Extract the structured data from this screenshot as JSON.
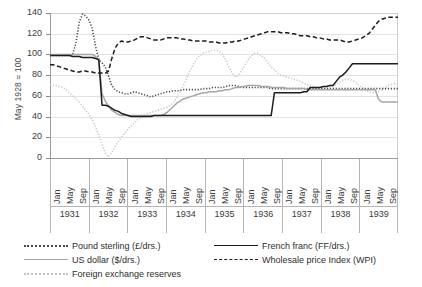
{
  "chart_data": {
    "type": "line",
    "title": "",
    "xlabel": "",
    "ylabel": "May 1928 = 100",
    "ylim": [
      0,
      140
    ],
    "ytick_labels": [
      "0",
      "20",
      "40",
      "60",
      "80",
      "100",
      "120",
      "140"
    ],
    "yticks": [
      0,
      20,
      40,
      60,
      80,
      100,
      120,
      140
    ],
    "grid": true,
    "legend_position": "bottom",
    "years": [
      "1931",
      "1932",
      "1933",
      "1934",
      "1935",
      "1936",
      "1937",
      "1938",
      "1939"
    ],
    "month_ticks": [
      "Jan",
      "May",
      "Sep"
    ],
    "x_start": "1931-01",
    "x_end": "1939-12",
    "series": [
      {
        "name": "Pound sterling (£/drs.)",
        "style": "dotted",
        "color": "#4a4a4a",
        "values": [
          99,
          99,
          99,
          99,
          99,
          99,
          99,
          100,
          112,
          131,
          139,
          137,
          133,
          125,
          108,
          95,
          92,
          88,
          79,
          70,
          66,
          64,
          63,
          62,
          62,
          63,
          64,
          63,
          62,
          61,
          60,
          59,
          60,
          61,
          62,
          63,
          64,
          64,
          65,
          65,
          65,
          66,
          66,
          66,
          66,
          66,
          66,
          67,
          67,
          67,
          68,
          68,
          68,
          68,
          69,
          70,
          70,
          70,
          69,
          68,
          68,
          68,
          68,
          68,
          68,
          68,
          68,
          68,
          67,
          67,
          67,
          67,
          67,
          67,
          67,
          67,
          67,
          67,
          67,
          67,
          67,
          67,
          67,
          67,
          67,
          67,
          67,
          67,
          67,
          67,
          67,
          67,
          67,
          67,
          67,
          67,
          67,
          67,
          67,
          67,
          67,
          67,
          67,
          67,
          67,
          67,
          67,
          67
        ]
      },
      {
        "name": "US dollar ($/drs.)",
        "style": "solid",
        "color": "#a6a6a6",
        "values": [
          100,
          100,
          100,
          100,
          100,
          100,
          100,
          100,
          100,
          100,
          100,
          100,
          100,
          100,
          98,
          95,
          62,
          55,
          50,
          46,
          44,
          42,
          41,
          41,
          41,
          41,
          41,
          41,
          41,
          41,
          41,
          41,
          41,
          41,
          41,
          42,
          44,
          47,
          50,
          53,
          55,
          57,
          58,
          59,
          60,
          61,
          62,
          63,
          63,
          64,
          64,
          64,
          65,
          65,
          66,
          66,
          67,
          68,
          68,
          69,
          69,
          70,
          70,
          70,
          70,
          69,
          69,
          69,
          68,
          68,
          68,
          68,
          68,
          67,
          67,
          67,
          67,
          67,
          67,
          66,
          66,
          66,
          66,
          66,
          66,
          66,
          66,
          66,
          66,
          66,
          66,
          66,
          66,
          66,
          66,
          66,
          66,
          66,
          66,
          66,
          66,
          57,
          54,
          54,
          54,
          54,
          54,
          54
        ]
      },
      {
        "name": "Foreign exchange reserves",
        "style": "dotted",
        "color": "#c9c9c9",
        "values": [
          71,
          70,
          70,
          69,
          68,
          66,
          63,
          60,
          57,
          54,
          50,
          46,
          42,
          37,
          30,
          22,
          13,
          5,
          1,
          5,
          11,
          16,
          20,
          24,
          28,
          31,
          34,
          37,
          39,
          41,
          43,
          44,
          45,
          46,
          47,
          48,
          49,
          51,
          54,
          58,
          64,
          70,
          77,
          84,
          90,
          95,
          99,
          101,
          102,
          103,
          104,
          104,
          103,
          100,
          95,
          88,
          82,
          78,
          80,
          85,
          90,
          95,
          99,
          101,
          101,
          99,
          96,
          92,
          88,
          85,
          82,
          80,
          79,
          78,
          77,
          76,
          75,
          74,
          72,
          71,
          70,
          69,
          68,
          68,
          67,
          67,
          68,
          69,
          71,
          73,
          75,
          76,
          76,
          75,
          73,
          70,
          68,
          66,
          64,
          63,
          63,
          64,
          66,
          68,
          70,
          71,
          72,
          71
        ]
      },
      {
        "name": "French franc (FF/drs.)",
        "style": "solid",
        "color": "#1d1d1d",
        "values": [
          99,
          99,
          99,
          99,
          99,
          99,
          99,
          98,
          98,
          98,
          97,
          97,
          97,
          97,
          96,
          95,
          51,
          51,
          50,
          48,
          46,
          45,
          43,
          42,
          41,
          40,
          40,
          40,
          40,
          40,
          40,
          40,
          41,
          41,
          41,
          41,
          41,
          41,
          41,
          41,
          41,
          41,
          41,
          41,
          41,
          41,
          41,
          41,
          41,
          41,
          41,
          41,
          41,
          41,
          41,
          41,
          41,
          41,
          41,
          41,
          41,
          41,
          41,
          41,
          41,
          41,
          41,
          41,
          41,
          63,
          63,
          63,
          63,
          63,
          63,
          63,
          63,
          63,
          64,
          64,
          68,
          68,
          68,
          68,
          69,
          69,
          70,
          70,
          74,
          78,
          80,
          83,
          87,
          91,
          91,
          91,
          91,
          91,
          91,
          91,
          91,
          91,
          91,
          91,
          91,
          91,
          91,
          91
        ]
      },
      {
        "name": "Wholesale price Index (WPI)",
        "style": "dashed",
        "color": "#1d1d1d",
        "values": [
          90,
          90,
          89,
          88,
          87,
          86,
          85,
          84,
          83,
          83,
          84,
          84,
          83,
          83,
          82,
          82,
          82,
          82,
          84,
          96,
          106,
          111,
          113,
          112,
          112,
          113,
          114,
          116,
          117,
          117,
          116,
          115,
          114,
          114,
          114,
          115,
          116,
          116,
          116,
          116,
          115,
          115,
          114,
          114,
          113,
          113,
          113,
          113,
          113,
          112,
          112,
          112,
          111,
          111,
          111,
          112,
          112,
          113,
          113,
          114,
          115,
          116,
          117,
          118,
          119,
          120,
          121,
          122,
          122,
          122,
          122,
          121,
          121,
          121,
          120,
          120,
          119,
          118,
          118,
          118,
          117,
          117,
          116,
          116,
          115,
          115,
          114,
          114,
          114,
          114,
          113,
          112,
          112,
          113,
          114,
          115,
          116,
          118,
          120,
          124,
          128,
          132,
          134,
          135,
          136,
          136,
          136,
          136
        ]
      }
    ]
  },
  "legend": {
    "items": [
      {
        "label": "Pound sterling (£/drs.)",
        "swatch": "sw-dot-dark",
        "col": 0,
        "row": 0
      },
      {
        "label": "US dollar ($/drs.)",
        "swatch": "sw-solid-gray",
        "col": 0,
        "row": 1
      },
      {
        "label": "Foreign exchange reserves",
        "swatch": "sw-dot-light",
        "col": 0,
        "row": 2
      },
      {
        "label": "French franc (FF/drs.)",
        "swatch": "sw-solid-black",
        "col": 1,
        "row": 0
      },
      {
        "label": "Wholesale price Index (WPI)",
        "swatch": "sw-dash",
        "col": 1,
        "row": 1
      }
    ]
  }
}
